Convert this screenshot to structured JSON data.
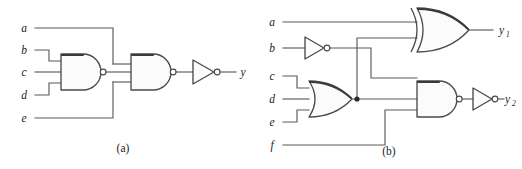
{
  "figure": {
    "background_color": "#ffffff",
    "wire_color": "#5a5a5a",
    "gate_outline_color": "#4a4a4a",
    "gate_fill_color": "#fbfbfb",
    "junction_color": "#2a2a2a"
  },
  "circuits": [
    {
      "id": "a",
      "caption": "(a)",
      "inputs": [
        {
          "label": "a"
        },
        {
          "label": "b"
        },
        {
          "label": "c"
        },
        {
          "label": "d"
        },
        {
          "label": "e"
        }
      ],
      "outputs": [
        {
          "label": "y"
        }
      ],
      "gates": [
        {
          "id": "a-nand1",
          "type": "nand",
          "inputs": 3,
          "input_labels": [
            "b",
            "c",
            "d"
          ]
        },
        {
          "id": "a-nand2",
          "type": "nand",
          "inputs": 3,
          "input_labels": [
            "a",
            "a-nand1",
            "e"
          ]
        },
        {
          "id": "a-inv1",
          "type": "inverter",
          "inputs": 1,
          "input_labels": [
            "a-nand2"
          ]
        }
      ]
    },
    {
      "id": "b",
      "caption": "(b)",
      "inputs": [
        {
          "label": "a"
        },
        {
          "label": "b"
        },
        {
          "label": "c"
        },
        {
          "label": "d"
        },
        {
          "label": "e"
        },
        {
          "label": "f"
        }
      ],
      "outputs": [
        {
          "label": "y",
          "subscript": "1"
        },
        {
          "label": "y",
          "subscript": "2"
        }
      ],
      "gates": [
        {
          "id": "b-xor1",
          "type": "xor",
          "inputs": 2,
          "input_labels": [
            "a",
            "b-or1"
          ]
        },
        {
          "id": "b-inv1",
          "type": "inverter",
          "inputs": 1,
          "input_labels": [
            "b"
          ]
        },
        {
          "id": "b-or1",
          "type": "or",
          "inputs": 3,
          "input_labels": [
            "c",
            "d",
            "e"
          ]
        },
        {
          "id": "b-nand1",
          "type": "nand",
          "inputs": 3,
          "input_labels": [
            "b-inv1",
            "b-or1",
            "f"
          ]
        },
        {
          "id": "b-inv2",
          "type": "inverter",
          "inputs": 1,
          "input_labels": [
            "b-nand1"
          ]
        }
      ]
    }
  ]
}
